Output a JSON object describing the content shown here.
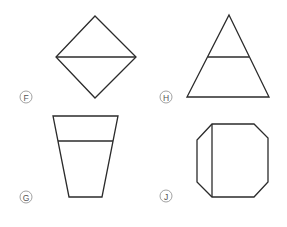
{
  "figure": {
    "options": [
      {
        "letter": "F",
        "shape": "diamond divided horizontally",
        "label_pos": [
          26,
          97
        ],
        "outline": [
          [
            95,
            16
          ],
          [
            136,
            57
          ],
          [
            95,
            98
          ],
          [
            56,
            57
          ]
        ],
        "divider": [
          [
            56,
            57
          ],
          [
            136,
            57
          ]
        ]
      },
      {
        "letter": "H",
        "shape": "triangle with horizontal line",
        "label_pos": [
          166,
          97
        ],
        "outline": [
          [
            229,
            15
          ],
          [
            269,
            97
          ],
          [
            187,
            97
          ]
        ],
        "divider": [
          [
            208,
            57
          ],
          [
            249,
            57
          ]
        ]
      },
      {
        "letter": "G",
        "shape": "inverted trapezoid with horizontal line",
        "label_pos": [
          26,
          197
        ],
        "outline": [
          [
            53,
            116
          ],
          [
            118,
            116
          ],
          [
            102,
            197
          ],
          [
            69,
            197
          ]
        ],
        "divider": [
          [
            58,
            141
          ],
          [
            113,
            141
          ]
        ]
      },
      {
        "letter": "J",
        "shape": "octagon with vertical line",
        "label_pos": [
          166,
          196
        ],
        "outline": [
          [
            212,
            124
          ],
          [
            254,
            124
          ],
          [
            268,
            138
          ],
          [
            268,
            182
          ],
          [
            254,
            197
          ],
          [
            212,
            197
          ],
          [
            197,
            182
          ],
          [
            197,
            140
          ]
        ],
        "divider": [
          [
            212,
            124
          ],
          [
            212,
            197
          ]
        ]
      }
    ]
  }
}
